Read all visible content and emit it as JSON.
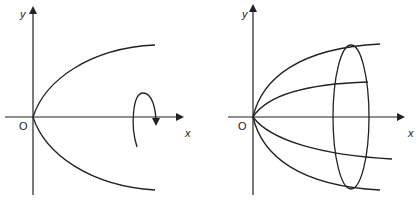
{
  "figures": [
    {
      "id": "left",
      "description": "parabola y^2 = kx with rotation arrow about x-axis",
      "labels": {
        "y_axis": "y",
        "x_axis": "x",
        "origin": "O"
      }
    },
    {
      "id": "right",
      "description": "paraboloid of revolution about x-axis",
      "labels": {
        "y_axis": "y",
        "x_axis": "x",
        "origin": "O"
      }
    }
  ],
  "colors": {
    "stroke": "#222222",
    "background": "#ffffff"
  }
}
